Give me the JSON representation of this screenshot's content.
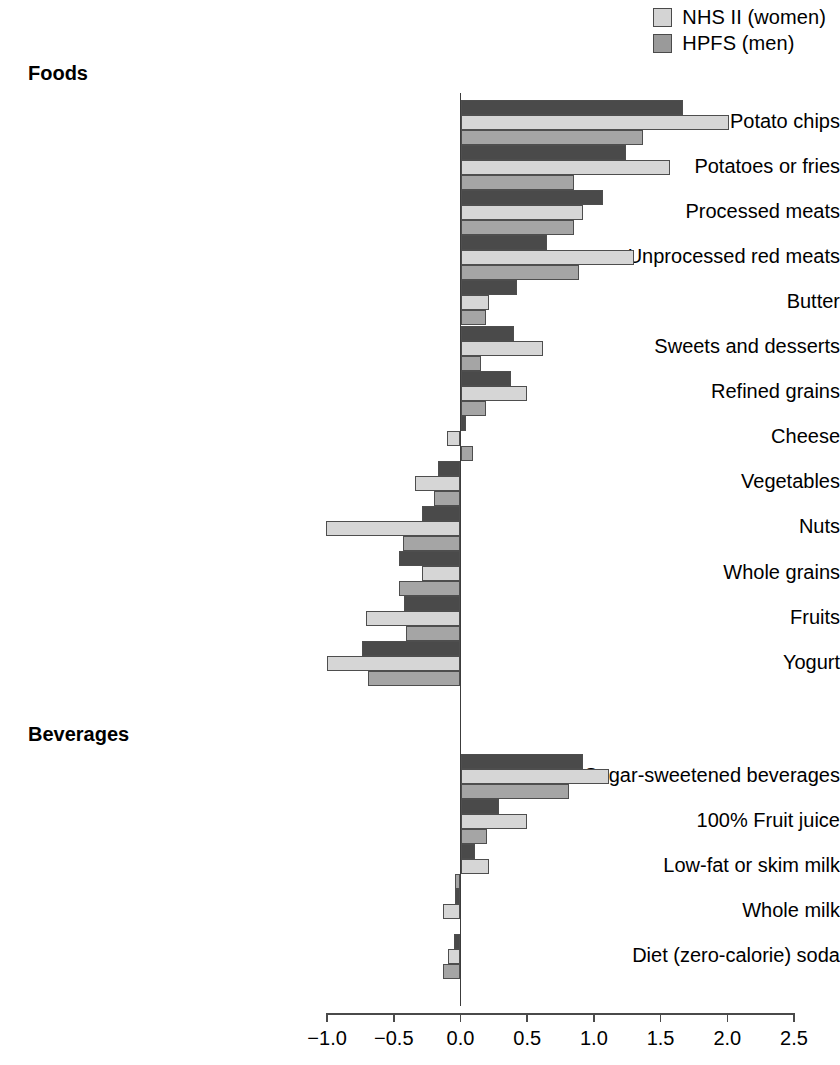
{
  "legend": {
    "position": "top-right",
    "items": [
      {
        "label": "NHS II (women)",
        "color": "#d4d4d4",
        "icon": "legend-swatch"
      },
      {
        "label": "HPFS (men)",
        "color": "#9a9a9a",
        "icon": "legend-swatch"
      }
    ]
  },
  "sections": [
    {
      "id": "foods",
      "title": "Foods"
    },
    {
      "id": "beverages",
      "title": "Beverages"
    }
  ],
  "axis": {
    "ticks": [
      "−1.0",
      "−0.5",
      "0.0",
      "0.5",
      "1.0",
      "1.5",
      "2.0",
      "2.5"
    ],
    "tick_values": [
      -1.0,
      -0.5,
      0.0,
      0.5,
      1.0,
      1.5,
      2.0,
      2.5
    ]
  },
  "colors": {
    "series_dark": "#4a4a4a",
    "series_light": "#d6d6d6",
    "series_mid": "#a5a5a5",
    "outline": "#4e4e4e",
    "axis": "#4a4a4a"
  },
  "chart_data": {
    "type": "bar",
    "orientation": "horizontal",
    "title": "",
    "xlabel": "",
    "ylabel": "",
    "xlim": [
      -1.0,
      2.5
    ],
    "grid": false,
    "legend_position": "top-right",
    "series": [
      {
        "name": "NHS I (women)",
        "color": "#4a4a4a",
        "values": [
          1.67,
          1.24,
          1.07,
          0.65,
          0.42,
          0.4,
          0.38,
          0.04,
          -0.17,
          -0.29,
          -0.46,
          -0.42,
          -0.74,
          0.92,
          0.29,
          0.11,
          -0.04,
          -0.05
        ]
      },
      {
        "name": "NHS II (women)",
        "color": "#d6d6d6",
        "values": [
          2.01,
          1.57,
          0.92,
          1.3,
          0.21,
          0.62,
          0.5,
          -0.1,
          -0.34,
          -1.01,
          -0.29,
          -0.71,
          -1.0,
          1.11,
          0.5,
          0.21,
          -0.13,
          -0.09
        ]
      },
      {
        "name": "HPFS (men)",
        "color": "#a5a5a5",
        "values": [
          1.37,
          0.85,
          0.85,
          0.89,
          0.19,
          0.15,
          0.19,
          0.09,
          -0.2,
          -0.43,
          -0.46,
          -0.41,
          -0.69,
          0.81,
          0.2,
          -0.04,
          0.0,
          -0.13
        ]
      }
    ],
    "categories": [
      {
        "label": "Potato chips",
        "section": "foods"
      },
      {
        "label": "Potatoes or fries",
        "section": "foods"
      },
      {
        "label": "Processed meats",
        "section": "foods"
      },
      {
        "label": "Unprocessed red meats",
        "section": "foods"
      },
      {
        "label": "Butter",
        "section": "foods"
      },
      {
        "label": "Sweets and desserts",
        "section": "foods"
      },
      {
        "label": "Refined grains",
        "section": "foods"
      },
      {
        "label": "Cheese",
        "section": "foods"
      },
      {
        "label": "Vegetables",
        "section": "foods"
      },
      {
        "label": "Nuts",
        "section": "foods"
      },
      {
        "label": "Whole grains",
        "section": "foods"
      },
      {
        "label": "Fruits",
        "section": "foods"
      },
      {
        "label": "Yogurt",
        "section": "foods"
      },
      {
        "label": "Sugar-sweetened beverages",
        "section": "beverages"
      },
      {
        "label": "100% Fruit juice",
        "section": "beverages"
      },
      {
        "label": "Low-fat or skim milk",
        "section": "beverages"
      },
      {
        "label": "Whole milk",
        "section": "beverages"
      },
      {
        "label": "Diet (zero-calorie) soda",
        "section": "beverages"
      }
    ]
  }
}
